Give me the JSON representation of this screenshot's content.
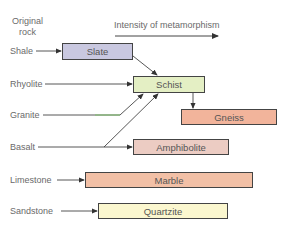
{
  "header": {
    "origin_label_line1": "Original",
    "origin_label_line2": "rock",
    "axis_label": "Intensity of metamorphism"
  },
  "original_rocks": [
    "Shale",
    "Rhyolite",
    "Granite",
    "Basalt",
    "Limestone",
    "Sandstone"
  ],
  "metamorphic_rocks": [
    {
      "name": "Slate",
      "color": "#c9c8e0"
    },
    {
      "name": "Schist",
      "color": "#e4efc4"
    },
    {
      "name": "Gneiss",
      "color": "#f2b49b"
    },
    {
      "name": "Amphibolite",
      "color": "#ecccc3"
    },
    {
      "name": "Marble",
      "color": "#f2c0a6"
    },
    {
      "name": "Quartzite",
      "color": "#fbf7cf"
    }
  ],
  "relationships": [
    {
      "from": "Shale",
      "to": "Slate"
    },
    {
      "from": "Slate",
      "to": "Schist"
    },
    {
      "from": "Rhyolite",
      "to": "Schist"
    },
    {
      "from": "Granite",
      "to": "Schist"
    },
    {
      "from": "Basalt",
      "to": "Schist"
    },
    {
      "from": "Basalt",
      "to": "Amphibolite"
    },
    {
      "from": "Schist",
      "to": "Gneiss"
    },
    {
      "from": "Limestone",
      "to": "Marble"
    },
    {
      "from": "Sandstone",
      "to": "Quartzite"
    }
  ]
}
